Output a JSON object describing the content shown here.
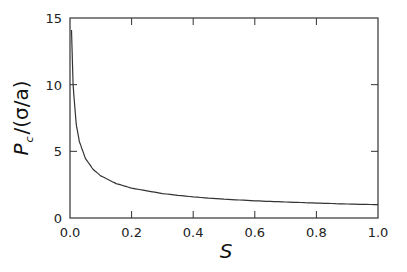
{
  "chart_data": {
    "type": "line",
    "title": "",
    "xlabel": "S",
    "ylabel": "P_c /(σ/a)",
    "ylabel_main": "P",
    "ylabel_sub": "c",
    "ylabel_rest": "/(σ/a)",
    "xlim": [
      0.0,
      1.0
    ],
    "ylim": [
      0,
      15
    ],
    "x_ticks": [
      "0.0",
      "0.2",
      "0.4",
      "0.6",
      "0.8",
      "1.0"
    ],
    "y_ticks": [
      "0",
      "5",
      "10",
      "15"
    ],
    "grid": false,
    "legend": null,
    "series": [
      {
        "name": "P_c/(σ/a) vs S",
        "color": "#333333",
        "x": [
          0.005,
          0.01,
          0.02,
          0.03,
          0.05,
          0.075,
          0.1,
          0.15,
          0.2,
          0.3,
          0.4,
          0.5,
          0.6,
          0.7,
          0.8,
          0.9,
          1.0
        ],
        "y": [
          14.1,
          10.0,
          7.07,
          5.77,
          4.47,
          3.65,
          3.16,
          2.58,
          2.24,
          1.83,
          1.58,
          1.41,
          1.29,
          1.2,
          1.12,
          1.05,
          1.0
        ]
      }
    ]
  }
}
